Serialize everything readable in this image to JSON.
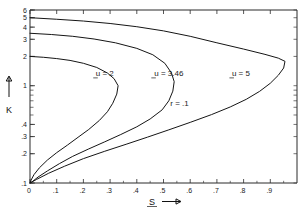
{
  "chart_data": {
    "type": "line",
    "title": "",
    "xlabel": "S",
    "ylabel": "K",
    "xlim": [
      0,
      1.0
    ],
    "ylim": [
      0.1,
      6
    ],
    "yscale": "log",
    "xscale": "linear",
    "grid": false,
    "legend_position": "inline-labels",
    "xticks": [
      "0",
      ".1",
      ".2",
      ".3",
      ".4",
      ".5",
      ".6",
      ".7",
      ".8",
      ".9"
    ],
    "xtick_values": [
      0,
      0.1,
      0.2,
      0.3,
      0.4,
      0.5,
      0.6,
      0.7,
      0.8,
      0.9
    ],
    "yticks": [
      "1",
      ".2",
      ".3",
      ".4",
      "1",
      "2",
      "3",
      "4",
      "5",
      "6"
    ],
    "ytick_values": [
      0.1,
      0.2,
      0.3,
      0.4,
      1,
      2,
      3,
      4,
      5,
      6
    ],
    "ytick_labels_shown": [
      ".1",
      ".2",
      ".3",
      ".4",
      "1",
      "2",
      "3",
      "4",
      "5",
      "6"
    ],
    "annotations": [
      {
        "text": "r = .1",
        "x": 0.56,
        "y": 0.62
      }
    ],
    "series": [
      {
        "name": "u = 2",
        "label": "u = 2",
        "label_x": 0.28,
        "label_y": 1.25,
        "points_upper": [
          [
            0.0,
            2.0
          ],
          [
            0.05,
            1.96
          ],
          [
            0.1,
            1.9
          ],
          [
            0.15,
            1.82
          ],
          [
            0.2,
            1.7
          ],
          [
            0.25,
            1.54
          ],
          [
            0.29,
            1.35
          ],
          [
            0.315,
            1.18
          ],
          [
            0.33,
            1.0
          ]
        ],
        "points_lower": [
          [
            0.33,
            1.0
          ],
          [
            0.325,
            0.82
          ],
          [
            0.31,
            0.66
          ],
          [
            0.29,
            0.54
          ],
          [
            0.26,
            0.44
          ],
          [
            0.22,
            0.355
          ],
          [
            0.18,
            0.295
          ],
          [
            0.14,
            0.245
          ],
          [
            0.1,
            0.205
          ],
          [
            0.065,
            0.172
          ],
          [
            0.035,
            0.143
          ],
          [
            0.015,
            0.122
          ],
          [
            0.004,
            0.107
          ],
          [
            0.0,
            0.1
          ]
        ]
      },
      {
        "name": "u = 3.46",
        "label": "u = 3.46",
        "label_x": 0.52,
        "label_y": 1.25,
        "points_upper": [
          [
            0.0,
            3.46
          ],
          [
            0.08,
            3.36
          ],
          [
            0.16,
            3.22
          ],
          [
            0.24,
            3.02
          ],
          [
            0.32,
            2.76
          ],
          [
            0.4,
            2.42
          ],
          [
            0.46,
            2.08
          ],
          [
            0.505,
            1.7
          ],
          [
            0.53,
            1.35
          ],
          [
            0.54,
            1.1
          ]
        ],
        "points_lower": [
          [
            0.54,
            1.1
          ],
          [
            0.535,
            0.88
          ],
          [
            0.52,
            0.7
          ],
          [
            0.495,
            0.565
          ],
          [
            0.45,
            0.455
          ],
          [
            0.4,
            0.378
          ],
          [
            0.34,
            0.315
          ],
          [
            0.28,
            0.265
          ],
          [
            0.22,
            0.224
          ],
          [
            0.16,
            0.188
          ],
          [
            0.11,
            0.158
          ],
          [
            0.065,
            0.133
          ],
          [
            0.03,
            0.115
          ],
          [
            0.008,
            0.103
          ],
          [
            0.0,
            0.1
          ]
        ]
      },
      {
        "name": "u = 5",
        "label": "u = 5",
        "label_x": 0.79,
        "label_y": 1.25,
        "points_upper": [
          [
            0.0,
            5.0
          ],
          [
            0.1,
            4.82
          ],
          [
            0.2,
            4.62
          ],
          [
            0.3,
            4.36
          ],
          [
            0.4,
            4.04
          ],
          [
            0.5,
            3.66
          ],
          [
            0.6,
            3.22
          ],
          [
            0.7,
            2.76
          ],
          [
            0.8,
            2.38
          ],
          [
            0.88,
            2.1
          ],
          [
            0.93,
            1.92
          ],
          [
            0.955,
            1.78
          ]
        ],
        "points_lower": [
          [
            0.955,
            1.78
          ],
          [
            0.95,
            1.52
          ],
          [
            0.93,
            1.28
          ],
          [
            0.9,
            1.06
          ],
          [
            0.86,
            0.875
          ],
          [
            0.81,
            0.725
          ],
          [
            0.75,
            0.605
          ],
          [
            0.68,
            0.505
          ],
          [
            0.6,
            0.42
          ],
          [
            0.52,
            0.352
          ],
          [
            0.44,
            0.296
          ],
          [
            0.36,
            0.25
          ],
          [
            0.28,
            0.212
          ],
          [
            0.2,
            0.178
          ],
          [
            0.13,
            0.149
          ],
          [
            0.07,
            0.126
          ],
          [
            0.025,
            0.109
          ],
          [
            0.0,
            0.1
          ]
        ]
      }
    ]
  },
  "axis": {
    "x_label": "S",
    "y_label": "K"
  }
}
